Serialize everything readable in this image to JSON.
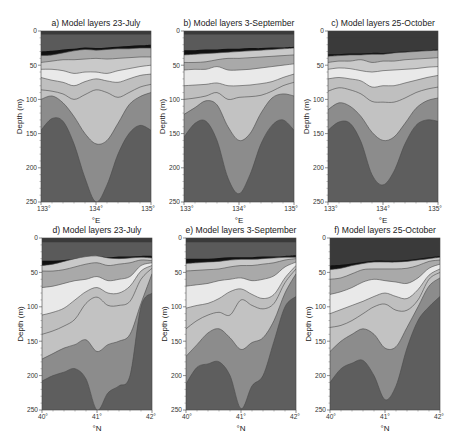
{
  "figure": {
    "panels": [
      {
        "id": "a",
        "title": "a) Model layers 23-July",
        "xlabel": "°E",
        "ylabel": "Depth (m)",
        "xticks": [
          "133°",
          "134°",
          "135°"
        ],
        "yticks": [
          "0",
          "50",
          "100",
          "150",
          "200",
          "250"
        ]
      },
      {
        "id": "b",
        "title": "b) Model layers 3-September",
        "xlabel": "°E",
        "ylabel": "Depth (m)",
        "xticks": [
          "133°",
          "134°",
          "135°"
        ],
        "yticks": [
          "0",
          "50",
          "100",
          "150",
          "200",
          "250"
        ]
      },
      {
        "id": "c",
        "title": "c) Model layers 25-October",
        "xlabel": "°E",
        "ylabel": "Depth (m)",
        "xticks": [
          "133°",
          "134°",
          "135°"
        ],
        "yticks": [
          "0",
          "50",
          "100",
          "150",
          "200",
          "250"
        ]
      },
      {
        "id": "d",
        "title": "d) Model layers 23-July",
        "xlabel": "°N",
        "ylabel": "Depth (m)",
        "xticks": [
          "40°",
          "41°",
          "42°"
        ],
        "yticks": [
          "0",
          "50",
          "100",
          "150",
          "200",
          "250"
        ]
      },
      {
        "id": "e",
        "title": "e) Model layers 3-September",
        "xlabel": "°N",
        "ylabel": "Depth (m)",
        "xticks": [
          "40°",
          "41°",
          "42°"
        ],
        "yticks": [
          "0",
          "50",
          "100",
          "150",
          "200",
          "250"
        ]
      },
      {
        "id": "f",
        "title": "f) Model layers 25-October",
        "xlabel": "°N",
        "ylabel": "Depth (m)",
        "xticks": [
          "40°",
          "41°",
          "42°"
        ],
        "yticks": [
          "0",
          "50",
          "100",
          "150",
          "200",
          "250"
        ]
      }
    ]
  },
  "chart_data": [
    {
      "type": "area",
      "title": "a) Model layers 23-July",
      "xlabel": "°E",
      "ylabel": "Depth (m)",
      "xlim": [
        133,
        135
      ],
      "ylim": [
        250,
        0
      ],
      "x_ticks": [
        133,
        134,
        135
      ],
      "y_ticks": [
        0,
        50,
        100,
        150,
        200,
        250
      ],
      "layer_colors": [
        "#3a3a3a",
        "#5a5a5a",
        "#111111",
        "#a9a9a9",
        "#c9c9c9",
        "#e9e9e9",
        "#bfbfbf",
        "#adadad",
        "#c2c2c2",
        "#8c8c8c",
        "#5e5e5e"
      ],
      "x": [
        0,
        0.1,
        0.2,
        0.3,
        0.4,
        0.5,
        0.6,
        0.7,
        0.8,
        0.9,
        1.0
      ],
      "interfaces": [
        [
          5,
          5,
          5,
          5,
          5,
          5,
          5,
          5,
          5,
          5,
          5
        ],
        [
          30,
          29,
          27,
          26,
          24,
          25,
          24,
          23,
          22,
          21,
          20
        ],
        [
          36,
          35,
          32,
          29,
          27,
          28,
          27,
          26,
          26,
          25,
          25
        ],
        [
          46,
          44,
          42,
          42,
          41,
          40,
          41,
          40,
          39,
          38,
          38
        ],
        [
          56,
          56,
          58,
          62,
          60,
          60,
          62,
          58,
          55,
          52,
          50
        ],
        [
          68,
          72,
          75,
          80,
          74,
          70,
          73,
          75,
          70,
          65,
          63
        ],
        [
          86,
          88,
          92,
          100,
          93,
          86,
          90,
          97,
          90,
          82,
          78
        ],
        [
          100,
          95,
          105,
          125,
          150,
          165,
          160,
          135,
          108,
          96,
          90
        ],
        [
          145,
          128,
          132,
          165,
          215,
          250,
          225,
          180,
          150,
          138,
          145
        ]
      ]
    },
    {
      "type": "area",
      "title": "b) Model layers 3-September",
      "xlabel": "°E",
      "ylabel": "Depth (m)",
      "xlim": [
        133,
        135
      ],
      "ylim": [
        250,
        0
      ],
      "x_ticks": [
        133,
        134,
        135
      ],
      "y_ticks": [
        0,
        50,
        100,
        150,
        200,
        250
      ],
      "layer_colors": [
        "#3a3a3a",
        "#5a5a5a",
        "#111111",
        "#c9c9c9",
        "#a9a9a9",
        "#e9e9e9",
        "#bfbfbf",
        "#adadad",
        "#c2c2c2",
        "#8c8c8c",
        "#5e5e5e"
      ],
      "x": [
        0,
        0.1,
        0.2,
        0.3,
        0.4,
        0.5,
        0.6,
        0.7,
        0.8,
        0.9,
        1.0
      ],
      "interfaces": [
        [
          5,
          5,
          5,
          5,
          5,
          5,
          5,
          5,
          5,
          5,
          5
        ],
        [
          28,
          28,
          27,
          27,
          26,
          26,
          25,
          25,
          24,
          24,
          23
        ],
        [
          35,
          34,
          33,
          32,
          31,
          30,
          29,
          28,
          27,
          26,
          25
        ],
        [
          46,
          46,
          45,
          42,
          40,
          40,
          39,
          38,
          37,
          36,
          35
        ],
        [
          57,
          56,
          56,
          52,
          57,
          57,
          56,
          54,
          52,
          50,
          48
        ],
        [
          80,
          79,
          78,
          76,
          80,
          80,
          79,
          77,
          74,
          68,
          63
        ],
        [
          100,
          98,
          95,
          90,
          100,
          97,
          96,
          94,
          88,
          80,
          75
        ],
        [
          122,
          112,
          102,
          108,
          140,
          160,
          150,
          120,
          98,
          92,
          95
        ],
        [
          155,
          135,
          132,
          160,
          215,
          238,
          210,
          165,
          138,
          130,
          145
        ]
      ]
    },
    {
      "type": "area",
      "title": "c) Model layers 25-October",
      "xlabel": "°E",
      "ylabel": "Depth (m)",
      "xlim": [
        133,
        135
      ],
      "ylim": [
        250,
        0
      ],
      "x_ticks": [
        133,
        134,
        135
      ],
      "y_ticks": [
        0,
        50,
        100,
        150,
        200,
        250
      ],
      "layer_colors": [
        "#3a3a3a",
        "#3a3a3a",
        "#111111",
        "#a9a9a9",
        "#c9c9c9",
        "#e9e9e9",
        "#bfbfbf",
        "#adadad",
        "#c2c2c2",
        "#8c8c8c",
        "#5e5e5e"
      ],
      "x": [
        0,
        0.1,
        0.2,
        0.3,
        0.4,
        0.5,
        0.6,
        0.7,
        0.8,
        0.9,
        1.0
      ],
      "interfaces": [
        [
          10,
          10,
          10,
          10,
          10,
          10,
          10,
          10,
          10,
          10,
          10
        ],
        [
          34,
          34,
          33,
          33,
          32,
          32,
          31,
          30,
          29,
          28,
          27
        ],
        [
          37,
          36,
          35,
          35,
          34,
          34,
          32,
          31,
          30,
          29,
          28
        ],
        [
          46,
          44,
          44,
          42,
          46,
          44,
          44,
          42,
          41,
          40,
          39
        ],
        [
          56,
          54,
          55,
          58,
          60,
          58,
          57,
          56,
          55,
          53,
          52
        ],
        [
          70,
          68,
          70,
          73,
          82,
          80,
          80,
          76,
          72,
          68,
          65
        ],
        [
          88,
          83,
          86,
          92,
          103,
          104,
          104,
          98,
          90,
          85,
          82
        ],
        [
          115,
          105,
          110,
          125,
          148,
          160,
          155,
          135,
          113,
          102,
          98
        ],
        [
          145,
          133,
          135,
          162,
          210,
          225,
          205,
          165,
          138,
          130,
          132
        ]
      ]
    },
    {
      "type": "area",
      "title": "d) Model layers 23-July",
      "xlabel": "°N",
      "ylabel": "Depth (m)",
      "xlim": [
        40,
        42
      ],
      "ylim": [
        250,
        0
      ],
      "x_ticks": [
        40,
        41,
        42
      ],
      "y_ticks": [
        0,
        50,
        100,
        150,
        200,
        250
      ],
      "layer_colors": [
        "#3a3a3a",
        "#5a5a5a",
        "#111111",
        "#c9c9c9",
        "#a9a9a9",
        "#e9e9e9",
        "#bfbfbf",
        "#adadad",
        "#c2c2c2",
        "#8c8c8c",
        "#5e5e5e"
      ],
      "x": [
        0,
        0.1,
        0.2,
        0.3,
        0.4,
        0.5,
        0.6,
        0.7,
        0.8,
        0.9,
        1.0
      ],
      "interfaces": [
        [
          6,
          6,
          6,
          6,
          6,
          6,
          6,
          6,
          6,
          6,
          6
        ],
        [
          33,
          33,
          32,
          30,
          28,
          27,
          28,
          27,
          27,
          26,
          26
        ],
        [
          40,
          38,
          34,
          30,
          27,
          26,
          29,
          30,
          29,
          28,
          29
        ],
        [
          48,
          48,
          46,
          42,
          38,
          36,
          40,
          38,
          36,
          32,
          33
        ],
        [
          72,
          70,
          66,
          62,
          60,
          56,
          62,
          60,
          56,
          40,
          36
        ],
        [
          112,
          108,
          102,
          90,
          78,
          72,
          80,
          80,
          70,
          48,
          40
        ],
        [
          140,
          135,
          128,
          118,
          95,
          86,
          98,
          98,
          92,
          60,
          44
        ],
        [
          176,
          168,
          160,
          155,
          148,
          165,
          155,
          150,
          140,
          95,
          52
        ],
        [
          208,
          200,
          195,
          190,
          205,
          250,
          225,
          215,
          200,
          100,
          80
        ]
      ]
    },
    {
      "type": "area",
      "title": "e) Model layers 3-September",
      "xlabel": "°N",
      "ylabel": "Depth (m)",
      "xlim": [
        40,
        42
      ],
      "ylim": [
        250,
        0
      ],
      "x_ticks": [
        40,
        41,
        42
      ],
      "y_ticks": [
        0,
        50,
        100,
        150,
        200,
        250
      ],
      "layer_colors": [
        "#3a3a3a",
        "#5a5a5a",
        "#111111",
        "#c9c9c9",
        "#a9a9a9",
        "#e9e9e9",
        "#bfbfbf",
        "#adadad",
        "#c2c2c2",
        "#8c8c8c",
        "#5e5e5e"
      ],
      "x": [
        0,
        0.1,
        0.2,
        0.3,
        0.4,
        0.5,
        0.6,
        0.7,
        0.8,
        0.9,
        1.0
      ],
      "interfaces": [
        [
          6,
          6,
          6,
          6,
          6,
          6,
          6,
          6,
          6,
          6,
          6
        ],
        [
          30,
          30,
          30,
          29,
          28,
          28,
          28,
          27,
          27,
          26,
          25
        ],
        [
          37,
          36,
          35,
          34,
          32,
          31,
          31,
          30,
          29,
          28,
          28
        ],
        [
          48,
          47,
          46,
          45,
          42,
          40,
          40,
          38,
          36,
          32,
          30
        ],
        [
          70,
          68,
          66,
          62,
          60,
          58,
          62,
          60,
          55,
          42,
          35
        ],
        [
          102,
          98,
          95,
          88,
          78,
          74,
          82,
          88,
          82,
          58,
          40
        ],
        [
          132,
          120,
          112,
          108,
          112,
          90,
          98,
          103,
          95,
          65,
          45
        ],
        [
          172,
          155,
          138,
          132,
          145,
          162,
          152,
          145,
          120,
          80,
          52
        ],
        [
          212,
          188,
          183,
          180,
          200,
          248,
          215,
          200,
          150,
          100,
          85
        ]
      ]
    },
    {
      "type": "area",
      "title": "f) Model layers 25-October",
      "xlabel": "°N",
      "ylabel": "Depth (m)",
      "xlim": [
        40,
        42
      ],
      "ylim": [
        250,
        0
      ],
      "x_ticks": [
        40,
        41,
        42
      ],
      "y_ticks": [
        0,
        50,
        100,
        150,
        200,
        250
      ],
      "layer_colors": [
        "#3a3a3a",
        "#3a3a3a",
        "#111111",
        "#c9c9c9",
        "#a9a9a9",
        "#e9e9e9",
        "#bfbfbf",
        "#adadad",
        "#c2c2c2",
        "#8c8c8c",
        "#5e5e5e"
      ],
      "x": [
        0,
        0.1,
        0.2,
        0.3,
        0.4,
        0.5,
        0.6,
        0.7,
        0.8,
        0.9,
        1.0
      ],
      "interfaces": [
        [
          10,
          10,
          10,
          10,
          10,
          10,
          10,
          10,
          10,
          10,
          10
        ],
        [
          40,
          39,
          37,
          35,
          33,
          33,
          33,
          32,
          30,
          28,
          26
        ],
        [
          46,
          44,
          40,
          37,
          35,
          35,
          35,
          34,
          32,
          30,
          28
        ],
        [
          60,
          58,
          52,
          46,
          45,
          45,
          45,
          44,
          40,
          34,
          32
        ],
        [
          82,
          78,
          72,
          64,
          60,
          62,
          64,
          66,
          58,
          44,
          38
        ],
        [
          110,
          104,
          98,
          92,
          85,
          80,
          85,
          88,
          75,
          54,
          45
        ],
        [
          130,
          127,
          120,
          110,
          100,
          96,
          105,
          105,
          90,
          60,
          50
        ],
        [
          165,
          150,
          140,
          132,
          140,
          160,
          158,
          130,
          100,
          70,
          58
        ],
        [
          210,
          190,
          182,
          178,
          200,
          235,
          215,
          160,
          120,
          100,
          85
        ]
      ]
    }
  ]
}
